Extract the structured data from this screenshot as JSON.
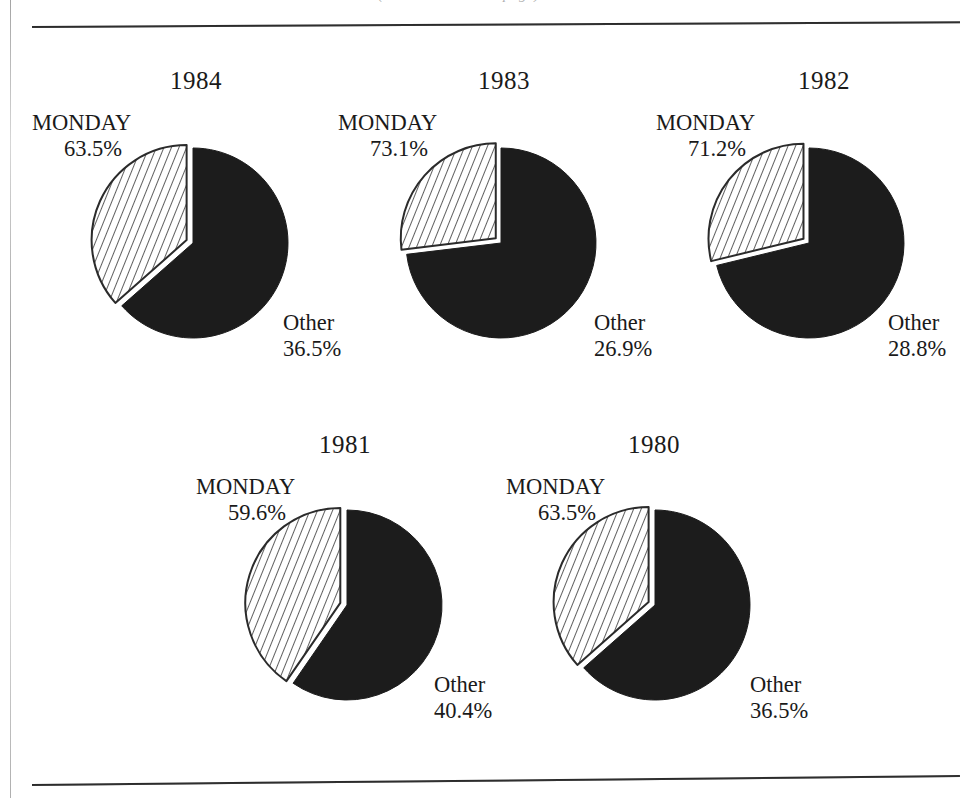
{
  "figure": {
    "clipped_caption": "(continued on next page)",
    "background_color": "#ffffff",
    "ink_color": "#1a1a1a",
    "monday_slice_color": "#1c1c1c",
    "other_slice_fill": "#ffffff",
    "other_slice_hatch_color": "#2b2b2b"
  },
  "chart_data": {
    "type": "pie",
    "title": "",
    "subtitle": "",
    "xlabel": "",
    "ylabel": "",
    "legend_position": "none",
    "grid": false,
    "units": "percent",
    "categories": [
      "MONDAY",
      "Other"
    ],
    "panel_variable": "year",
    "charts": [
      {
        "title": "1984",
        "labels": [
          "MONDAY",
          "Other"
        ],
        "values": [
          63.5,
          36.5
        ],
        "value_labels": [
          "63.5%",
          "36.5%"
        ],
        "exploded_slice": "Other"
      },
      {
        "title": "1983",
        "labels": [
          "MONDAY",
          "Other"
        ],
        "values": [
          73.1,
          26.9
        ],
        "value_labels": [
          "73.1%",
          "26.9%"
        ],
        "exploded_slice": "Other"
      },
      {
        "title": "1982",
        "labels": [
          "MONDAY",
          "Other"
        ],
        "values": [
          71.2,
          28.8
        ],
        "value_labels": [
          "71.2%",
          "28.8%"
        ],
        "exploded_slice": "Other"
      },
      {
        "title": "1981",
        "labels": [
          "MONDAY",
          "Other"
        ],
        "values": [
          59.6,
          40.4
        ],
        "value_labels": [
          "59.6%",
          "40.4%"
        ],
        "exploded_slice": "Other"
      },
      {
        "title": "1980",
        "labels": [
          "MONDAY",
          "Other"
        ],
        "values": [
          63.5,
          36.5
        ],
        "value_labels": [
          "63.5%",
          "36.5%"
        ],
        "exploded_slice": "Other"
      }
    ]
  },
  "panels": [
    {
      "year": "1984",
      "monday_name": "MONDAY",
      "monday_value": "63.5%",
      "other_name": "Other",
      "other_value": "36.5%"
    },
    {
      "year": "1983",
      "monday_name": "MONDAY",
      "monday_value": "73.1%",
      "other_name": "Other",
      "other_value": "26.9%"
    },
    {
      "year": "1982",
      "monday_name": "MONDAY",
      "monday_value": "71.2%",
      "other_name": "Other",
      "other_value": "28.8%"
    },
    {
      "year": "1981",
      "monday_name": "MONDAY",
      "monday_value": "59.6%",
      "other_name": "Other",
      "other_value": "40.4%"
    },
    {
      "year": "1980",
      "monday_name": "MONDAY",
      "monday_value": "63.5%",
      "other_name": "Other",
      "other_value": "36.5%"
    }
  ]
}
